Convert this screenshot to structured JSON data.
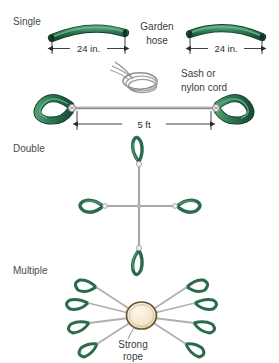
{
  "figure": {
    "background_color": "#ffffff",
    "palette": {
      "hose_dark_green": "#1f5c3f",
      "hose_mid_green": "#2f7a52",
      "hose_light_green": "#5aa87a",
      "hose_outline": "#143f2c",
      "cord_gray": "#9a9a9a",
      "cord_gray_dark": "#6f6f6f",
      "rope_fill": "#f7ecd9",
      "rope_outline": "#6b5332",
      "text_color": "#3a3a3a",
      "dim_line": "#2b2b2b"
    }
  },
  "sections": [
    {
      "id": "single",
      "label": "Single"
    },
    {
      "id": "double",
      "label": "Double"
    },
    {
      "id": "multiple",
      "label": "Multiple"
    }
  ],
  "callouts": {
    "garden_hose_line1": "Garden",
    "garden_hose_line2": "hose",
    "sash_cord_line1": "Sash or",
    "sash_cord_line2": "nylon cord",
    "strong_rope_line1": "Strong",
    "strong_rope_line2": "rope"
  },
  "dimensions": {
    "hose_left": "24 in.",
    "hose_right": "24 in.",
    "assembly_length": "5 ft"
  },
  "counts": {
    "single_hose_segments": 2,
    "double_loops": 4,
    "multiple_loops": 8
  }
}
